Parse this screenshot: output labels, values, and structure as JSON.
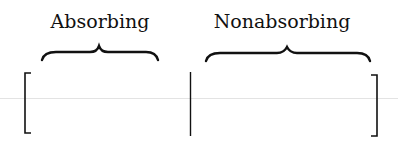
{
  "diagram": {
    "labels": {
      "left": "Absorbing",
      "right": "Nonabsorbing"
    },
    "colors": {
      "ink": "#111111",
      "guide_line": "#e3e3e3"
    }
  }
}
